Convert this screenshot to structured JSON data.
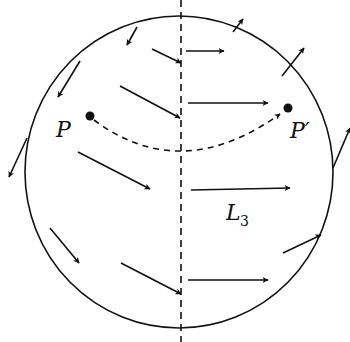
{
  "figure": {
    "type": "vector-field-diagram",
    "stroke_color": "#111111",
    "background": "#ffffff",
    "circle": {
      "cx": 179,
      "cy": 172,
      "rx": 154,
      "ry": 156
    },
    "axis_line": {
      "x": 181,
      "y1": 0,
      "y2": 342,
      "style": "dashed"
    },
    "labels": {
      "point_p": "P",
      "point_p_prime": "P′",
      "line_label": "L",
      "line_label_subscript": "3"
    },
    "points": [
      {
        "name": "P",
        "x": 90,
        "y": 116
      },
      {
        "name": "P′",
        "x": 288,
        "y": 108
      }
    ],
    "dashed_path": {
      "from": "P",
      "to": "P′",
      "description": "curved dashed trajectory from P to P′ dipping below the line"
    },
    "arrows": [
      {
        "x1": 137,
        "y1": 27,
        "x2": 127,
        "y2": 45
      },
      {
        "x1": 152,
        "y1": 49,
        "x2": 181,
        "y2": 63
      },
      {
        "x1": 186,
        "y1": 51,
        "x2": 224,
        "y2": 51
      },
      {
        "x1": 233,
        "y1": 32,
        "x2": 243,
        "y2": 19
      },
      {
        "x1": 80,
        "y1": 61,
        "x2": 58,
        "y2": 97
      },
      {
        "x1": 282,
        "y1": 76,
        "x2": 304,
        "y2": 48
      },
      {
        "x1": 120,
        "y1": 86,
        "x2": 180,
        "y2": 118
      },
      {
        "x1": 188,
        "y1": 103,
        "x2": 268,
        "y2": 103
      },
      {
        "x1": 27,
        "y1": 138,
        "x2": 9,
        "y2": 177
      },
      {
        "x1": 333,
        "y1": 168,
        "x2": 350,
        "y2": 128
      },
      {
        "x1": 78,
        "y1": 152,
        "x2": 150,
        "y2": 189
      },
      {
        "x1": 191,
        "y1": 190,
        "x2": 290,
        "y2": 188
      },
      {
        "x1": 50,
        "y1": 228,
        "x2": 79,
        "y2": 263
      },
      {
        "x1": 283,
        "y1": 253,
        "x2": 321,
        "y2": 235
      },
      {
        "x1": 121,
        "y1": 263,
        "x2": 181,
        "y2": 294
      },
      {
        "x1": 188,
        "y1": 280,
        "x2": 268,
        "y2": 280
      }
    ]
  }
}
